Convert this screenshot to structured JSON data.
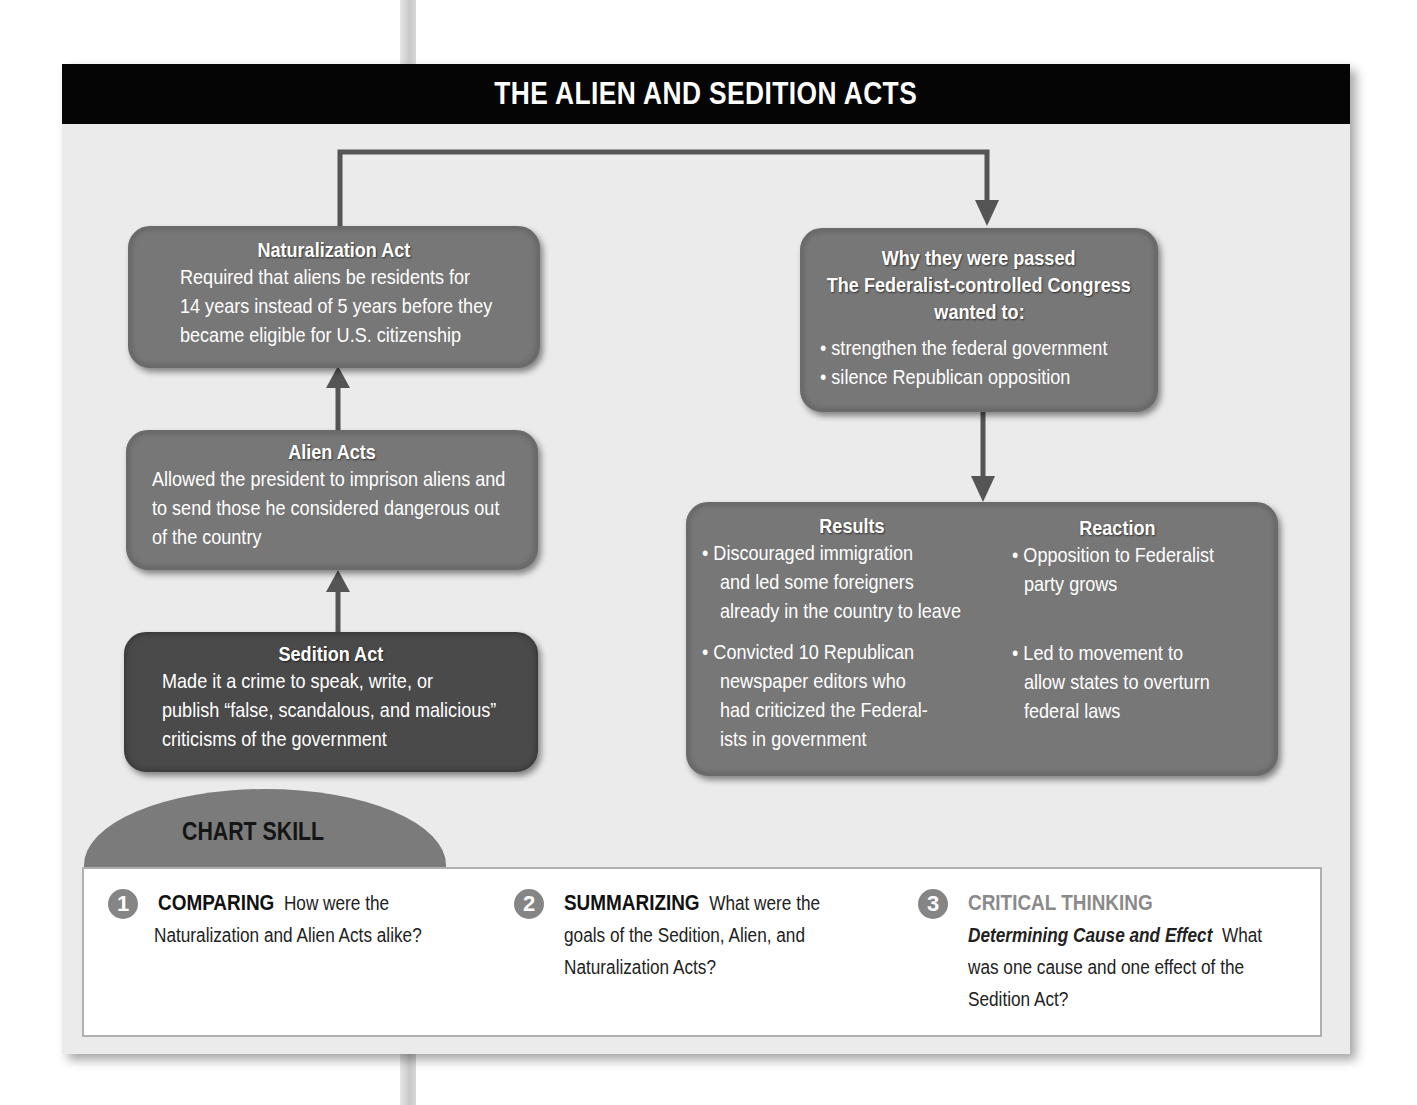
{
  "title": "THE ALIEN AND SEDITION ACTS",
  "boxes": {
    "naturalization": {
      "heading": "Naturalization Act",
      "lines": [
        "Required that aliens be residents for",
        "14 years instead of 5 years before they",
        "became eligible for U.S. citizenship"
      ]
    },
    "alien": {
      "heading": "Alien Acts",
      "lines": [
        "Allowed the president to imprison aliens and",
        "to send those he considered dangerous out",
        "of the country"
      ]
    },
    "sedition": {
      "heading": "Sedition Act",
      "lines": [
        "Made it a crime to speak, write, or",
        "publish “false, scandalous, and malicious”",
        "criticisms of the government"
      ]
    },
    "why": {
      "heading_lines": [
        "Why they were passed",
        "The Federalist-controlled Congress",
        "wanted to:"
      ],
      "bullets": [
        "• strengthen the federal government",
        "• silence Republican opposition"
      ]
    },
    "results": {
      "heading": "Results",
      "bullet1": [
        "• Discouraged immigration",
        "and led some foreigners",
        "already in the country to leave"
      ],
      "bullet2": [
        "• Convicted 10 Republican",
        "newspaper editors who",
        "had criticized the Federal-",
        "ists in government"
      ]
    },
    "reaction": {
      "heading": "Reaction",
      "bullet1": [
        "• Opposition to Federalist",
        "party grows"
      ],
      "bullet2": [
        "• Led to movement to",
        "allow states to overturn",
        "federal laws"
      ]
    }
  },
  "chart_skill": {
    "label": "CHART SKILL",
    "questions": [
      {
        "number": "1",
        "keyword": "COMPARING",
        "text_inline": "How were the",
        "lines": [
          "Naturalization and Alien Acts alike?"
        ]
      },
      {
        "number": "2",
        "keyword": "SUMMARIZING",
        "text_inline": "What were the",
        "lines": [
          "goals of the Sedition, Alien, and",
          "Naturalization Acts?"
        ]
      },
      {
        "number": "3",
        "keyword": "CRITICAL THINKING",
        "subtitle": "Determining Cause and Effect",
        "text_inline": "What",
        "lines": [
          "was one cause and one effect of the",
          "Sedition Act?"
        ]
      }
    ]
  },
  "colors": {
    "title_bar": "#050505",
    "box_fill": "#777777",
    "box_dark_fill": "#4a4a4a",
    "panel_bg": "#ebebeb",
    "connector": "#555555"
  }
}
